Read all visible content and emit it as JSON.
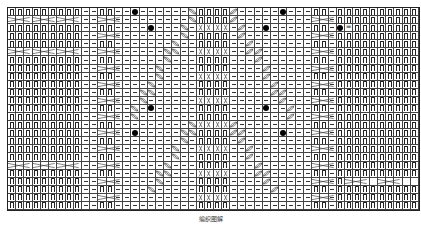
{
  "chart": {
    "type": "knitting-chart",
    "columns": 50,
    "rows": 25,
    "caption": "编织图解",
    "legend_symbols": {
      "k": "knit-stitch",
      "p": "purl-stitch",
      "dot": "bobble",
      "eq": "equals-sign",
      "cable": "cable-cross",
      "twist": "twisted-stitch"
    },
    "annotation_number": "5",
    "colors": {
      "grid": "#444444",
      "ink": "#222222",
      "background": "#ffffff"
    }
  }
}
